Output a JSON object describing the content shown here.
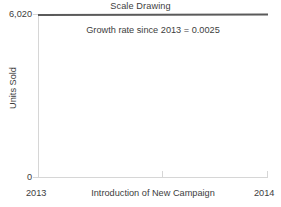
{
  "chart_data": {
    "type": "line",
    "title": "Scale Drawing",
    "xlabel": "Introduction of New Campaign",
    "ylabel": "Units Sold",
    "x": [
      2013,
      2014
    ],
    "series": [
      {
        "name": "Units Sold",
        "values": [
          6005,
          6020
        ]
      }
    ],
    "xlim": [
      2013,
      2014
    ],
    "ylim": [
      0,
      6020
    ],
    "ytick_labels": [
      "0",
      "6,020"
    ],
    "ytick_values": [
      0,
      6020
    ],
    "xtick_labels": [
      "2013",
      "2014"
    ],
    "xtick_values": [
      2013,
      2014
    ],
    "grid": false,
    "legend": false,
    "annotations": [
      {
        "text": "Growth rate since 2013 = 0.0025",
        "x": 2013.5,
        "y": 5800
      }
    ],
    "line_color": "#5a5a5a",
    "axis_color": "#d6d6d6",
    "text_color": "#3d3d3d"
  },
  "chart": {
    "title": "Scale Drawing",
    "annotation": "Growth rate since 2013 = 0.0025",
    "y_axis": {
      "title": "Units Sold",
      "max_label": "6,020",
      "min_label": "0"
    },
    "x_axis": {
      "title": "Introduction of New Campaign",
      "start_label": "2013",
      "end_label": "2014"
    }
  }
}
